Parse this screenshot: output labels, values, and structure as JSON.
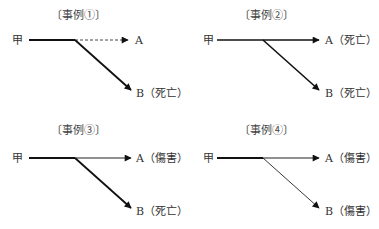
{
  "cases": [
    {
      "title": "〔事例①〕",
      "origin_label": "甲",
      "a_label": "A",
      "b_label": "B（死亡）",
      "a_line": "dashed",
      "b_line": "thick",
      "a_outcome": "",
      "b_outcome": "死亡"
    },
    {
      "title": "〔事例②〕",
      "origin_label": "甲",
      "a_label": "A（死亡）",
      "b_label": "B（死亡）",
      "a_line": "thick",
      "b_line": "thick",
      "a_outcome": "死亡",
      "b_outcome": "死亡"
    },
    {
      "title": "〔事例③〕",
      "origin_label": "甲",
      "a_label": "A（傷害）",
      "b_label": "B（死亡）",
      "a_line": "thin",
      "b_line": "thick",
      "a_outcome": "傷害",
      "b_outcome": "死亡"
    },
    {
      "title": "〔事例④〕",
      "origin_label": "甲",
      "a_label": "A（傷害）",
      "b_label": "B（傷害）",
      "a_line": "thin",
      "b_line": "thin",
      "a_outcome": "傷害",
      "b_outcome": "傷害"
    }
  ]
}
